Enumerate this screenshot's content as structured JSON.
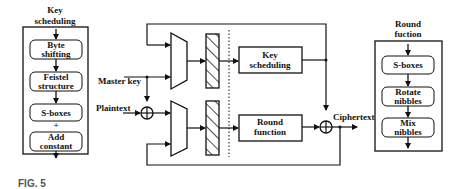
{
  "left_panel": {
    "title_line1": "Key",
    "title_line2": "scheduling",
    "steps": [
      {
        "line1": "Byte",
        "line2": "shifting"
      },
      {
        "line1": "Feistel",
        "line2": "structure"
      },
      {
        "line1": "S-boxes",
        "line2": ""
      },
      {
        "line1": "Add",
        "line2": "constant"
      }
    ]
  },
  "center": {
    "master_key_label": "Master key",
    "plaintext_label": "Plaintext",
    "ciphertext_label": "Ciphertext",
    "key_scheduling_line1": "Key",
    "key_scheduling_line2": "scheduling",
    "round_function_line1": "Round",
    "round_function_line2": "function"
  },
  "right_panel": {
    "title_line1": "Round",
    "title_line2": "fuction",
    "steps": [
      {
        "line1": "S-boxes",
        "line2": ""
      },
      {
        "line1": "Rotate",
        "line2": "nibbles"
      },
      {
        "line1": "Mix",
        "line2": "nibbles"
      }
    ]
  },
  "caption": "FIG. 5"
}
